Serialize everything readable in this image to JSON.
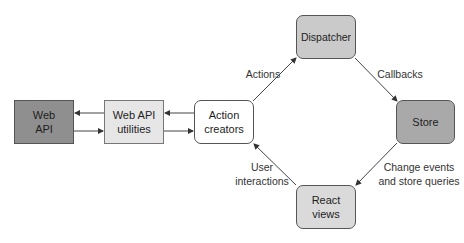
{
  "diagram": {
    "nodes": {
      "web_api": {
        "label": "Web\nAPI",
        "fill": "#8f8f8f",
        "shape": "rect"
      },
      "web_api_utilities": {
        "label": "Web API\nutilities",
        "fill": "#e6e6e6",
        "shape": "rect"
      },
      "action_creators": {
        "label": "Action\ncreators",
        "fill": "#ffffff",
        "shape": "rounded-rect"
      },
      "dispatcher": {
        "label": "Dispatcher",
        "fill": "#cacaca",
        "shape": "rounded-rect"
      },
      "store": {
        "label": "Store",
        "fill": "#a9a9a9",
        "shape": "rounded-rect"
      },
      "react_views": {
        "label": "React\nviews",
        "fill": "#dadada",
        "shape": "rounded-rect"
      }
    },
    "edges": {
      "actions": {
        "label": "Actions",
        "from": "Action creators",
        "to": "Dispatcher"
      },
      "callbacks": {
        "label": "Callbacks",
        "from": "Dispatcher",
        "to": "Store"
      },
      "change_events": {
        "label": "Change events\nand store queries",
        "from": "Store",
        "to": "React views"
      },
      "user_interactions": {
        "label": "User\ninteractions",
        "from": "React views",
        "to": "Action creators"
      },
      "creators_to_utilities": {
        "from": "Action creators",
        "to": "Web API utilities"
      },
      "utilities_to_creators": {
        "from": "Web API utilities",
        "to": "Action creators"
      },
      "utilities_to_api": {
        "from": "Web API utilities",
        "to": "Web API"
      },
      "api_to_utilities": {
        "from": "Web API",
        "to": "Web API utilities"
      }
    }
  }
}
